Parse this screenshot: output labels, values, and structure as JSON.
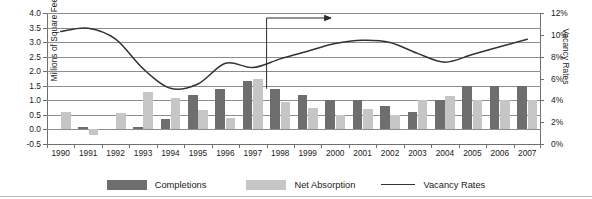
{
  "axes": {
    "left_title": "Millions of Square Feet",
    "right_title": "Vacancy Rates",
    "left_ticks": [
      "4.0",
      "3.5",
      "3.0",
      "2.5",
      "2.0",
      "1.5",
      "1.0",
      "0.5",
      "0.0",
      "-0.5"
    ],
    "right_ticks": [
      "12%",
      "10%",
      "8%",
      "6%",
      "4%",
      "2%",
      "0%"
    ]
  },
  "legend": {
    "completions": "Completions",
    "net_absorption": "Net Absorption",
    "vacancy_rates": "Vacancy Rates"
  },
  "chart_data": {
    "type": "bar",
    "title": "",
    "xlabel": "",
    "ylabel": "Millions of Square Feet",
    "y2label": "Vacancy Rates",
    "ylim": [
      -0.5,
      4.0
    ],
    "y2lim": [
      0,
      12
    ],
    "ytick_step": 0.5,
    "y2tick_step": 2,
    "grid": true,
    "legend_position": "bottom",
    "categories": [
      "1990",
      "1991",
      "1992",
      "1993",
      "1994",
      "1995",
      "1996",
      "1997",
      "1998",
      "1999",
      "2000",
      "2001",
      "2002",
      "2003",
      "2004",
      "2005",
      "2006",
      "2007"
    ],
    "series": [
      {
        "name": "Completions",
        "type": "bar",
        "axis": "left",
        "color": "#6e6e6e",
        "values": [
          0.0,
          0.1,
          0.0,
          0.07,
          0.35,
          1.2,
          1.4,
          1.65,
          1.4,
          1.2,
          1.0,
          1.0,
          0.8,
          0.6,
          1.0,
          1.5,
          1.5,
          1.5
        ]
      },
      {
        "name": "Net Absorption",
        "type": "bar",
        "axis": "left",
        "color": "#c6c6c6",
        "values": [
          0.6,
          -0.2,
          0.58,
          1.27,
          1.08,
          0.68,
          0.4,
          1.75,
          0.95,
          0.75,
          0.5,
          0.7,
          0.5,
          1.0,
          1.15,
          1.0,
          1.0,
          1.0
        ]
      },
      {
        "name": "Vacancy Rates",
        "type": "line",
        "axis": "right",
        "color": "#333333",
        "values": [
          10.3,
          10.6,
          9.6,
          6.9,
          5.1,
          5.5,
          7.4,
          7.0,
          7.8,
          8.5,
          9.2,
          9.5,
          9.3,
          8.3,
          7.5,
          8.2,
          8.9,
          9.6
        ]
      }
    ],
    "annotation": {
      "type": "arrow",
      "at_category": "1997",
      "direction": "right",
      "note": "vertical marker at 1997/1998 boundary with rightward arrow"
    }
  }
}
